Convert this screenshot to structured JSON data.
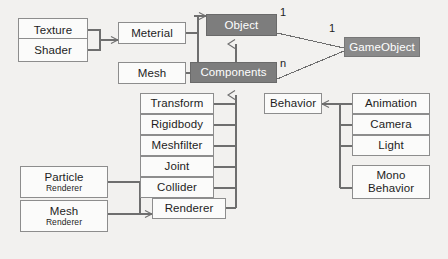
{
  "diagram": {
    "background_color": "#f2f1ef",
    "box_fill": "#fbfbfa",
    "box_border": "#8d8d8d",
    "highlight_fill": "#7d7d7d",
    "highlight_alt_fill": "#8a8a8a",
    "highlight_text": "#ffffff",
    "line_color": "#6e6e6e",
    "nodes": [
      {
        "id": "texture",
        "label": "Texture",
        "style": "plain"
      },
      {
        "id": "shader",
        "label": "Shader",
        "style": "plain"
      },
      {
        "id": "meterial",
        "label": "Meterial",
        "style": "plain"
      },
      {
        "id": "mesh",
        "label": "Mesh",
        "style": "plain"
      },
      {
        "id": "object",
        "label": "Object",
        "style": "filled"
      },
      {
        "id": "gameobject",
        "label": "GameObject",
        "style": "filled-alt"
      },
      {
        "id": "components",
        "label": "Components",
        "style": "filled"
      },
      {
        "id": "transform",
        "label": "Transform",
        "style": "plain"
      },
      {
        "id": "rigidbody",
        "label": "Rigidbody",
        "style": "plain"
      },
      {
        "id": "meshfilter",
        "label": "Meshfilter",
        "style": "plain"
      },
      {
        "id": "joint",
        "label": "Joint",
        "style": "plain"
      },
      {
        "id": "collider",
        "label": "Collider",
        "style": "plain"
      },
      {
        "id": "renderer",
        "label": "Renderer",
        "style": "plain"
      },
      {
        "id": "behavior",
        "label": "Behavior",
        "style": "plain"
      },
      {
        "id": "animation",
        "label": "Animation",
        "style": "plain"
      },
      {
        "id": "camera",
        "label": "Camera",
        "style": "plain"
      },
      {
        "id": "light",
        "label": "Light",
        "style": "plain"
      },
      {
        "id": "particle_renderer",
        "label_top": "Particle",
        "label_bottom": "Renderer",
        "style": "plain"
      },
      {
        "id": "mesh_renderer",
        "label_top": "Mesh",
        "label_bottom": "Renderer",
        "style": "plain"
      },
      {
        "id": "mono_behavior",
        "label_top": "Mono",
        "label_bottom": "Behavior",
        "style": "plain"
      }
    ],
    "multiplicities": [
      {
        "id": "object_to_gameobject",
        "label": "1"
      },
      {
        "id": "gameobject_multiplicity",
        "label": "1"
      },
      {
        "id": "components_to_gameobject",
        "label": "n"
      }
    ]
  }
}
